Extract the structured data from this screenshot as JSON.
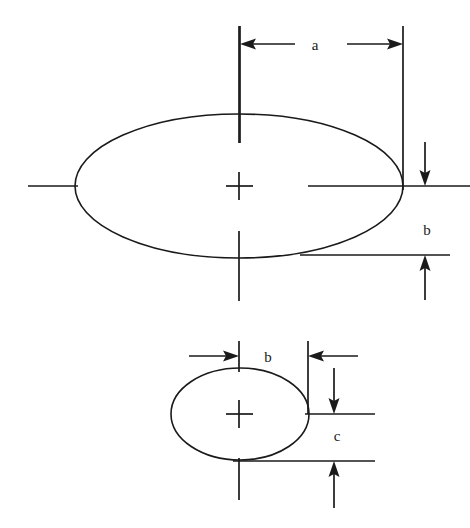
{
  "figure": {
    "type": "engineering-dimension-diagram",
    "background_color": "#ffffff",
    "line_color": "#1a1a1a",
    "width": 470,
    "height": 528
  },
  "labels": {
    "a": "a",
    "b_upper": "b",
    "b_lower": "b",
    "c": "c"
  },
  "shapes": {
    "large_ellipse": {
      "name": "large-ellipse",
      "cx": 239,
      "cy": 186,
      "rx": 164,
      "ry": 72
    },
    "small_ellipse": {
      "name": "small-ellipse",
      "cx": 240,
      "cy": 414,
      "rx": 69,
      "ry": 46
    }
  },
  "dimensions": [
    {
      "label": "a",
      "orientation": "horizontal",
      "from_x": 240,
      "to_x": 403,
      "y": 44,
      "arrow_direction": "outward",
      "label_x": 315,
      "label_y": 50
    },
    {
      "label": "b",
      "orientation": "vertical",
      "from_y": 186,
      "to_y": 255,
      "x": 425,
      "arrow_direction": "outward",
      "label_x": 427,
      "label_y": 235
    },
    {
      "label": "b",
      "orientation": "horizontal",
      "from_x": 239,
      "to_x": 308,
      "y": 356,
      "arrow_direction": "inward",
      "label_x": 268,
      "label_y": 362
    },
    {
      "label": "c",
      "orientation": "vertical",
      "from_y": 414,
      "to_y": 461,
      "x": 334,
      "arrow_direction": "outward",
      "label_x": 337,
      "label_y": 441
    }
  ]
}
